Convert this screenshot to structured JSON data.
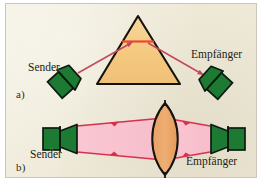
{
  "figure": {
    "background_color": "#efead8",
    "page_color": "#ffffff"
  },
  "panels": [
    {
      "id": "a",
      "label": "a)",
      "optic": "prism",
      "description": "Sender und Empfänger schräg auf ein Prisma gerichtet",
      "sender_label": "Sender",
      "receiver_label": "Empfänger"
    },
    {
      "id": "b",
      "label": "b)",
      "optic": "lens",
      "description": "Sender und Empfänger mit Sammellinse zwischen den Schallwandlern",
      "sender_label": "Sender",
      "receiver_label": "Empfänger"
    }
  ],
  "labels": {
    "panel_a": "a)",
    "panel_b": "b)",
    "sender_a": "Sender",
    "empfaenger_a": "Empfänger",
    "sender_b": "Sender",
    "empfaenger_b": "Empfänger"
  },
  "colors": {
    "background": "#efead8",
    "transducer_fill": "#1d7a32",
    "transducer_stroke": "#0d1a10",
    "prism_fill": "#f5cd87",
    "prism_stroke": "#15130d",
    "lens_fill": "#e9a262",
    "lens_stroke": "#15130d",
    "beam_fill": "#f8c3cf",
    "beam_stroke": "#d6324f",
    "ray_stroke": "#c4475e",
    "focus_line": "#f0452f",
    "text": "#1d1c17"
  },
  "elements": {
    "prism": "triangular-prism",
    "lens": "biconvex-lens",
    "beam": "pink-sound-beam",
    "ray": "ray-with-arrowhead",
    "focus_line": "red-focal-line"
  }
}
